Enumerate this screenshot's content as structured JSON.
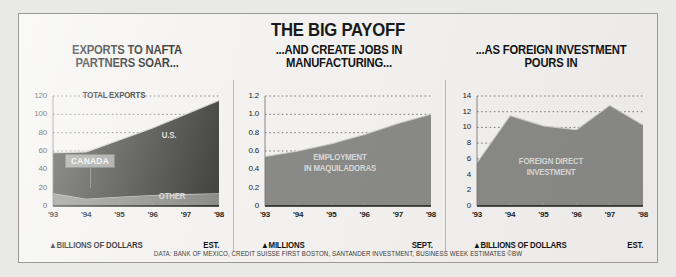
{
  "figure": {
    "headline": "THE BIG PAYOFF",
    "source": "DATA: BANK OF MEXICO, CREDIT SUISSE FIRST BOSTON, SANTANDER INVESTMENT, BUSINESS WEEK ESTIMATES   ©BW",
    "colors": {
      "panel_background": "#f3f2f0",
      "area_dark": "#4a4a48",
      "area_mid": "#8d8d8b",
      "area_light": "#a8a8a6",
      "frame": "#9a9a98",
      "text": "#1a1a1a"
    }
  },
  "chart_data": [
    {
      "type": "area",
      "title": "EXPORTS TO NAFTA PARTNERS SOAR...",
      "title_lines": [
        "EXPORTS TO NAFTA",
        "PARTNERS SOAR..."
      ],
      "stacked": true,
      "xlabel": "▲BILLIONS OF DOLLARS",
      "xnote_right": "EST.",
      "ylabel": "",
      "x": [
        "'93",
        "'94",
        "'95",
        "'96",
        "'97",
        "'98"
      ],
      "xtick_labels": [
        "'93",
        "'94",
        "'95",
        "'96",
        "'97",
        "'98"
      ],
      "ytick_labels": [
        "0",
        "20",
        "40",
        "60",
        "80",
        "100",
        "120"
      ],
      "yticks": [
        0,
        20,
        40,
        60,
        80,
        100,
        120
      ],
      "ylim": [
        0,
        120
      ],
      "grid": "dotted-horizontal",
      "series": [
        {
          "name": "CANADA AND OTHER",
          "values": [
            14,
            8,
            10,
            12,
            13,
            14
          ]
        },
        {
          "name": "U.S.",
          "values": [
            44,
            51,
            62,
            73,
            87,
            101
          ]
        }
      ],
      "totals": [
        58,
        59,
        72,
        85,
        100,
        115
      ],
      "annotations": [
        {
          "text": "TOTAL EXPORTS",
          "tone": "dark"
        },
        {
          "text": "U.S.",
          "tone": "light"
        },
        {
          "text": "OTHER",
          "tone": "light"
        },
        {
          "text": "CANADA",
          "tone": "callout"
        }
      ]
    },
    {
      "type": "area",
      "title": "...AND CREATE JOBS IN MANUFACTURING...",
      "title_lines": [
        "...AND CREATE JOBS IN",
        "MANUFACTURING..."
      ],
      "stacked": false,
      "xlabel": "▲MILLIONS",
      "xnote_right": "SEPT.",
      "ylabel": "",
      "x": [
        "'93",
        "'94",
        "'95",
        "'96",
        "'97",
        "'98"
      ],
      "xtick_labels": [
        "'93",
        "'94",
        "'95",
        "'96",
        "'97",
        "'98"
      ],
      "ytick_labels": [
        "0",
        "0.2",
        "0.4",
        "0.6",
        "0.8",
        "1.0",
        "1.2"
      ],
      "yticks": [
        0,
        0.2,
        0.4,
        0.6,
        0.8,
        1.0,
        1.2
      ],
      "ylim": [
        0,
        1.2
      ],
      "grid": "dotted-horizontal",
      "series": [
        {
          "name": "EMPLOYMENT IN MAQUILADORAS",
          "values": [
            0.54,
            0.6,
            0.68,
            0.78,
            0.9,
            1.0
          ]
        }
      ],
      "annotations": [
        {
          "text": "EMPLOYMENT",
          "tone": "light"
        },
        {
          "text": "IN MAQUILADORAS",
          "tone": "light"
        }
      ]
    },
    {
      "type": "area",
      "title": "...AS FOREIGN INVESTMENT POURS IN",
      "title_lines": [
        "...AS FOREIGN INVESTMENT",
        "POURS IN"
      ],
      "stacked": false,
      "xlabel": "▲BILLIONS OF DOLLARS",
      "xnote_right": "EST.",
      "ylabel": "",
      "x": [
        "'93",
        "'94",
        "'95",
        "'96",
        "'97",
        "'98"
      ],
      "xtick_labels": [
        "'93",
        "'94",
        "'95",
        "'96",
        "'97",
        "'98"
      ],
      "ytick_labels": [
        "0",
        "2",
        "4",
        "6",
        "8",
        "10",
        "12",
        "14"
      ],
      "yticks": [
        0,
        2,
        4,
        6,
        8,
        10,
        12,
        14
      ],
      "ylim": [
        0,
        14
      ],
      "grid": "dotted-horizontal",
      "series": [
        {
          "name": "FOREIGN DIRECT INVESTMENT",
          "values": [
            5.5,
            11.5,
            10.2,
            9.7,
            12.8,
            10.3
          ]
        }
      ],
      "annotations": [
        {
          "text": "FOREIGN DIRECT",
          "tone": "light"
        },
        {
          "text": "INVESTMENT",
          "tone": "light"
        }
      ]
    }
  ]
}
